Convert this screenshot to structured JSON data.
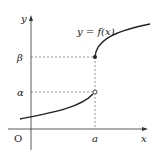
{
  "diagram": {
    "axes": {
      "x_label": "x",
      "y_label": "y",
      "origin_label": "O"
    },
    "curve_label": "y = f(x)",
    "x_ticks": [
      {
        "label": "a"
      }
    ],
    "y_ticks": [
      {
        "label": "β"
      },
      {
        "label": "α"
      }
    ],
    "points": [
      {
        "name": "closed-point",
        "x": "a",
        "y": "β",
        "filled": true
      },
      {
        "name": "open-point",
        "x": "a",
        "y": "α",
        "filled": false
      }
    ],
    "colors": {
      "stroke": "#222222",
      "guide": "#444444"
    }
  }
}
